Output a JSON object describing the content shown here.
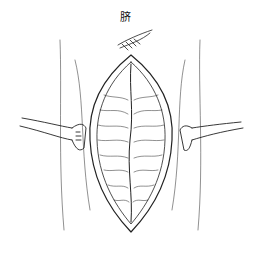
{
  "figure": {
    "labels": {
      "umbilicus": "脐"
    },
    "colors": {
      "line": "#222222",
      "background": "#ffffff"
    }
  }
}
